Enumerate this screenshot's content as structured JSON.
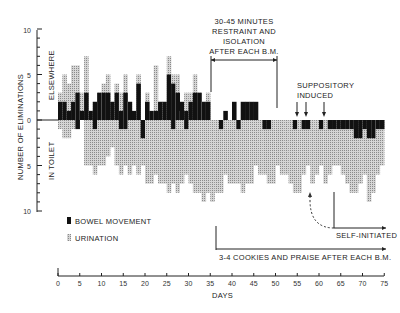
{
  "chart_data": {
    "type": "bar",
    "title": "",
    "xlabel": "DAYS",
    "ylabel": "NUMBER OF ELIMINATIONS",
    "upper_region_label": "ELSEWHERE",
    "lower_region_label": "IN TOILET",
    "ylim": [
      -10,
      10
    ],
    "y_ticks_labels": [
      "10",
      "5",
      "0",
      "5",
      "10"
    ],
    "x_ticks": [
      0,
      5,
      10,
      15,
      20,
      25,
      30,
      35,
      40,
      45,
      50,
      55,
      60,
      65,
      70,
      75
    ],
    "xlim": [
      0,
      75
    ],
    "legend": [
      {
        "name": "BOWEL MOVEMENT",
        "style": "solid black"
      },
      {
        "name": "URINATION",
        "style": "gray hatched"
      }
    ],
    "days": [
      1,
      2,
      3,
      4,
      5,
      6,
      7,
      8,
      9,
      10,
      11,
      12,
      13,
      14,
      15,
      16,
      17,
      18,
      19,
      20,
      21,
      22,
      23,
      24,
      25,
      26,
      27,
      28,
      29,
      30,
      31,
      32,
      33,
      34,
      35,
      36,
      37,
      38,
      39,
      40,
      41,
      42,
      43,
      44,
      45,
      46,
      47,
      48,
      49,
      50,
      51,
      52,
      53,
      54,
      55,
      56,
      57,
      58,
      59,
      60,
      61,
      62,
      63,
      64,
      65,
      66,
      67,
      68,
      69,
      70,
      71,
      72,
      73,
      74,
      75
    ],
    "series": [
      {
        "name": "Bowel movement elsewhere",
        "values": [
          2,
          2,
          1,
          2,
          3,
          1,
          3,
          1,
          2,
          3,
          3,
          3,
          2,
          3,
          1,
          3,
          2,
          1,
          4,
          0,
          2,
          1,
          1,
          2,
          2,
          5,
          4,
          3,
          2,
          1,
          2,
          3,
          3,
          2,
          2,
          0,
          0,
          0,
          1,
          0,
          2,
          0,
          2,
          2,
          2,
          2,
          0,
          0,
          0,
          0,
          0,
          0,
          0,
          0,
          0,
          0,
          0,
          0,
          0,
          0,
          0,
          0,
          0,
          0,
          0,
          0,
          0,
          0,
          0,
          0,
          0,
          0,
          0,
          0,
          0
        ]
      },
      {
        "name": "Urination elsewhere",
        "values": [
          3,
          5,
          4,
          6,
          6,
          3,
          7,
          1,
          2,
          3,
          4,
          5,
          2,
          4,
          3,
          5,
          2,
          0,
          5,
          0,
          3,
          0,
          6,
          2,
          2,
          7,
          5,
          5,
          1,
          3,
          3,
          5,
          3,
          2,
          3,
          0,
          0,
          0,
          0,
          0,
          0,
          0,
          0,
          0,
          0,
          0,
          0,
          0,
          0,
          0,
          0,
          0,
          0,
          0,
          0,
          0,
          0,
          0,
          0,
          0,
          0,
          0,
          0,
          0,
          0,
          0,
          0,
          0,
          0,
          0,
          0,
          0,
          0,
          0,
          0
        ]
      },
      {
        "name": "Bowel movement in toilet",
        "values": [
          0,
          0,
          0,
          0,
          1,
          0,
          0,
          0,
          1,
          0,
          0,
          0,
          0,
          0,
          1,
          1,
          0,
          0,
          0,
          2,
          0,
          0,
          0,
          0,
          0,
          0,
          1,
          0,
          0,
          1,
          0,
          0,
          0,
          0,
          0,
          0,
          0,
          1,
          0,
          0,
          0,
          1,
          0,
          0,
          0,
          0,
          0,
          1,
          1,
          0,
          0,
          0,
          0,
          0,
          1,
          0,
          1,
          1,
          0,
          0,
          1,
          0,
          1,
          1,
          1,
          1,
          1,
          1,
          2,
          2,
          1,
          2,
          2,
          1,
          1
        ]
      },
      {
        "name": "Urination in toilet",
        "values": [
          1,
          2,
          2,
          1,
          0,
          0,
          5,
          5,
          6,
          5,
          5,
          4,
          3,
          5,
          6,
          5,
          6,
          5,
          6,
          5,
          7,
          7,
          6,
          7,
          7,
          8,
          7,
          8,
          7,
          6,
          7,
          8,
          8,
          9,
          8,
          9,
          8,
          8,
          6,
          7,
          7,
          7,
          8,
          7,
          7,
          5,
          6,
          6,
          7,
          7,
          5,
          6,
          6,
          7,
          8,
          8,
          6,
          5,
          7,
          6,
          5,
          7,
          6,
          5,
          5,
          6,
          7,
          8,
          8,
          7,
          6,
          9,
          8,
          6,
          5
        ]
      }
    ],
    "annotations": [
      {
        "text": "30-45 MINUTES RESTRAINT AND ISOLATION AFTER EACH B.M.",
        "x_range": [
          35,
          50
        ]
      },
      {
        "text": "SUPPOSITORY INDUCED",
        "arrows_at_days": [
          55,
          57,
          61
        ]
      },
      {
        "text": "SELF-INITIATED",
        "x_range": [
          63,
          75
        ]
      },
      {
        "text": "3-4 COOKIES AND PRAISE AFTER EACH B.M.",
        "x_range": [
          35,
          75
        ]
      }
    ]
  },
  "labels": {
    "ylabel": "NUMBER OF ELIMINATIONS",
    "elsewhere": "ELSEWHERE",
    "in_toilet": "IN TOILET",
    "xlabel": "DAYS",
    "legend_bm": "BOWEL MOVEMENT",
    "legend_ur": "URINATION",
    "ann1_l1": "30-45 MINUTES",
    "ann1_l2": "RESTRAINT AND",
    "ann1_l3": "ISOLATION",
    "ann1_l4": "AFTER EACH B.M.",
    "ann2_l1": "SUPPOSITORY",
    "ann2_l2": "INDUCED",
    "ann3": "SELF-INITIATED",
    "ann4": "3-4 COOKIES AND PRAISE AFTER EACH B.M.",
    "ytick_top": "10",
    "ytick_5a": "5",
    "ytick_0": "0",
    "ytick_5b": "5",
    "ytick_bot": "10"
  }
}
